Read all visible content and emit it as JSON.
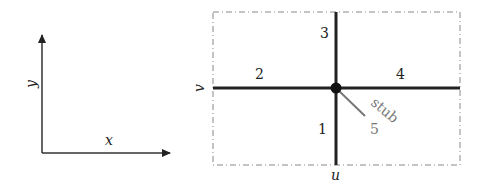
{
  "axes": {
    "x_label": "x",
    "y_label": "y"
  },
  "junction": {
    "u_label": "u",
    "v_label": "v",
    "branches": [
      {
        "id": "1",
        "label": "1",
        "direction": "down"
      },
      {
        "id": "2",
        "label": "2",
        "direction": "left"
      },
      {
        "id": "3",
        "label": "3",
        "direction": "up"
      },
      {
        "id": "4",
        "label": "4",
        "direction": "right"
      },
      {
        "id": "5",
        "label": "5",
        "direction": "diagonal-down-right"
      }
    ],
    "stub_label": "stub"
  }
}
